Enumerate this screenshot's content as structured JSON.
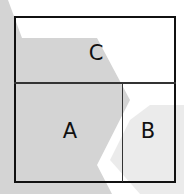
{
  "diagram": {
    "regions": [
      {
        "id": "C",
        "label": "C",
        "position": "top strip"
      },
      {
        "id": "A",
        "label": "A",
        "position": "bottom-left"
      },
      {
        "id": "B",
        "label": "B",
        "position": "bottom-right"
      }
    ],
    "colors": {
      "background": "#ffffff",
      "chevron_dark": "#d4d4d4",
      "chevron_light": "#ebebeb",
      "lines": "#111111"
    }
  }
}
